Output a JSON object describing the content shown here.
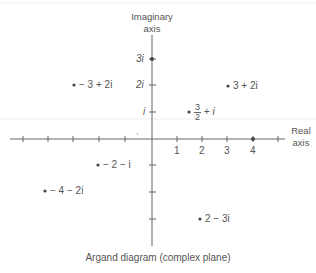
{
  "diagram": {
    "title": "Argand diagram (complex plane)",
    "imag_axis_label": [
      "Imaginary",
      "axis"
    ],
    "real_axis_label": [
      "Real",
      "axis"
    ],
    "real_tick_labels": [
      "1",
      "2",
      "3",
      "4"
    ],
    "imag_tick_labels": [
      "3i",
      "2i",
      "i"
    ],
    "points": [
      {
        "re": 3,
        "im": 0,
        "label": "3i",
        "note": "on imaginary axis",
        "text": "3i"
      },
      {
        "re": 4,
        "im": 0,
        "label": "4",
        "note": "on real axis"
      },
      {
        "re": -3,
        "im": 2,
        "text": "− 3 + 2i"
      },
      {
        "re": 3,
        "im": 2,
        "text": "3 + 2i"
      },
      {
        "re": 1.5,
        "im": 1,
        "text_num": "3",
        "text_den": "2",
        "text_rest": "+ i"
      },
      {
        "re": -2,
        "im": -1,
        "text": "− 2 − i"
      },
      {
        "re": -4,
        "im": -2,
        "text": "− 4 − 2i"
      },
      {
        "re": 2,
        "im": -3,
        "text": "2 − 3i"
      }
    ],
    "colors": {
      "ink": "#555555",
      "background": "#ffffff"
    }
  }
}
